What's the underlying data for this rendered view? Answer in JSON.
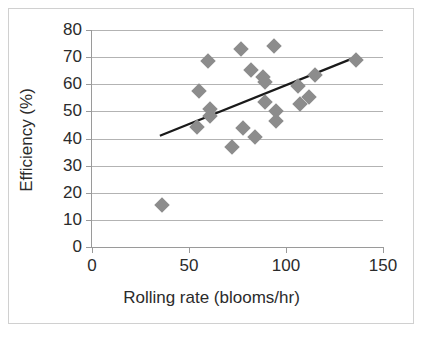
{
  "chart_data": {
    "type": "scatter",
    "title": "",
    "xlabel": "Rolling rate (blooms/hr)",
    "ylabel": "Efficiency (%)",
    "xlim": [
      0,
      150
    ],
    "ylim": [
      0,
      80
    ],
    "xticks": [
      0,
      50,
      100,
      150
    ],
    "yticks": [
      0,
      10,
      20,
      30,
      40,
      50,
      60,
      70,
      80
    ],
    "grid": "horizontal",
    "legend": "none",
    "marker_shape": "diamond",
    "marker_color": "#8c8c8c",
    "points": [
      {
        "x": 36,
        "y": 15.5
      },
      {
        "x": 55,
        "y": 57.5
      },
      {
        "x": 54,
        "y": 44.2
      },
      {
        "x": 60,
        "y": 68.5
      },
      {
        "x": 61,
        "y": 51.0
      },
      {
        "x": 61,
        "y": 48.3
      },
      {
        "x": 72,
        "y": 37.0
      },
      {
        "x": 77,
        "y": 73.0
      },
      {
        "x": 78,
        "y": 44.0
      },
      {
        "x": 82,
        "y": 65.2
      },
      {
        "x": 84,
        "y": 40.5
      },
      {
        "x": 88,
        "y": 62.8
      },
      {
        "x": 89,
        "y": 61.0
      },
      {
        "x": 89,
        "y": 53.3
      },
      {
        "x": 94,
        "y": 74.2
      },
      {
        "x": 95,
        "y": 50.3
      },
      {
        "x": 95,
        "y": 46.3
      },
      {
        "x": 106,
        "y": 59.5
      },
      {
        "x": 107,
        "y": 52.6
      },
      {
        "x": 112,
        "y": 55.4
      },
      {
        "x": 115,
        "y": 63.5
      },
      {
        "x": 136,
        "y": 69.0
      }
    ],
    "trendline": {
      "type": "linear",
      "color": "#1a1a1a",
      "x_start": 35,
      "y_start": 41.0,
      "x_end": 136,
      "y_end": 70.0
    }
  },
  "axes": {
    "y_labels": [
      "80",
      "70",
      "60",
      "50",
      "40",
      "30",
      "20",
      "10",
      "0"
    ],
    "x_labels": [
      "0",
      "50",
      "100",
      "150"
    ]
  }
}
